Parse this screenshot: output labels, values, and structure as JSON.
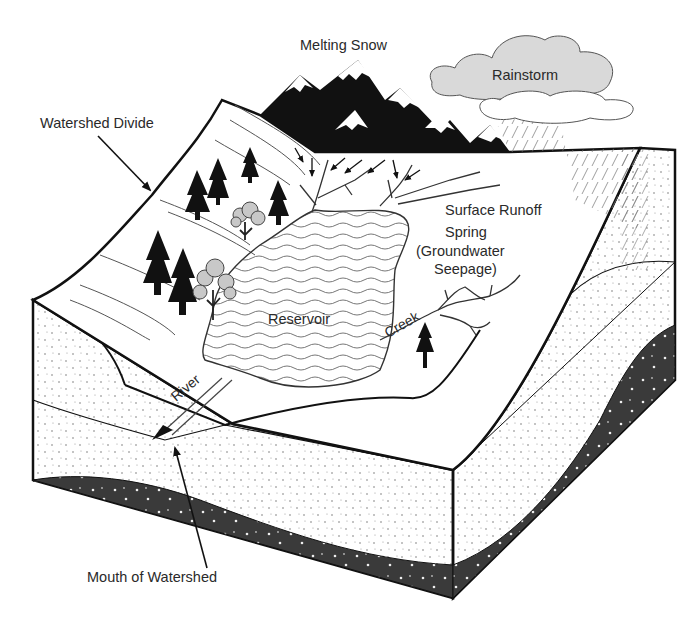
{
  "labels": {
    "melting_snow": "Melting Snow",
    "rainstorm": "Rainstorm",
    "watershed_divide": "Watershed Divide",
    "surface_runoff": "Surface Runoff",
    "spring_line1": "Spring",
    "spring_line2": "(Groundwater",
    "spring_line3": "Seepage)",
    "creek": "Creek",
    "reservoir": "Reservoir",
    "river": "River",
    "mouth_of_watershed": "Mouth of Watershed"
  },
  "colors": {
    "ink": "#111111",
    "bedrock": "#3a3a3a",
    "cloud": "#d9d9d9",
    "foliage": "#c8c8c8",
    "water_line": "#666666"
  }
}
